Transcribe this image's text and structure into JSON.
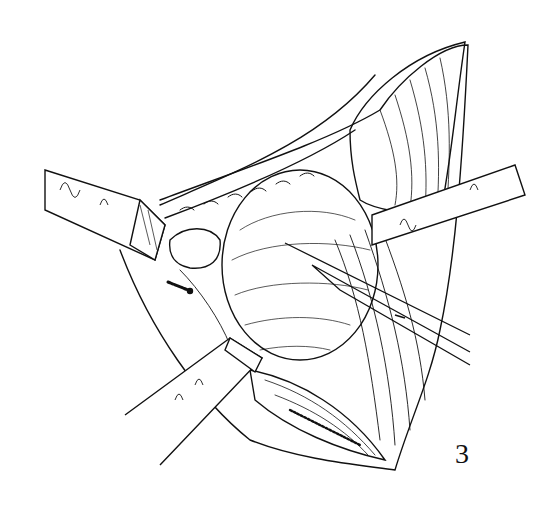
{
  "figure": {
    "number": "3",
    "colors": {
      "ink": "#111111",
      "paper": "#ffffff"
    }
  }
}
